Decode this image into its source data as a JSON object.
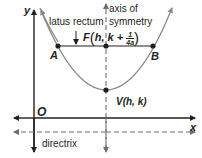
{
  "diagram": {
    "type": "parabola-anatomy",
    "colors": {
      "parabola": "#8a8a8a",
      "axes": "#231f20",
      "text": "#231f20",
      "dashed": "#6d6d6d"
    },
    "axes": {
      "x_label": "x",
      "y_label": "y",
      "origin_label": "O"
    },
    "labels": {
      "latus_rectum": "latus rectum",
      "axis_of_symmetry_line1": "axis of",
      "axis_of_symmetry_line2": "symmetry",
      "directrix": "directrix",
      "point_a": "A",
      "point_b": "B",
      "focus_prefix": "F",
      "focus_h": "h, ",
      "focus_k": "k + ",
      "focus_frac_num": "1",
      "focus_frac_den": "4a",
      "vertex": "V(h, k)"
    }
  }
}
